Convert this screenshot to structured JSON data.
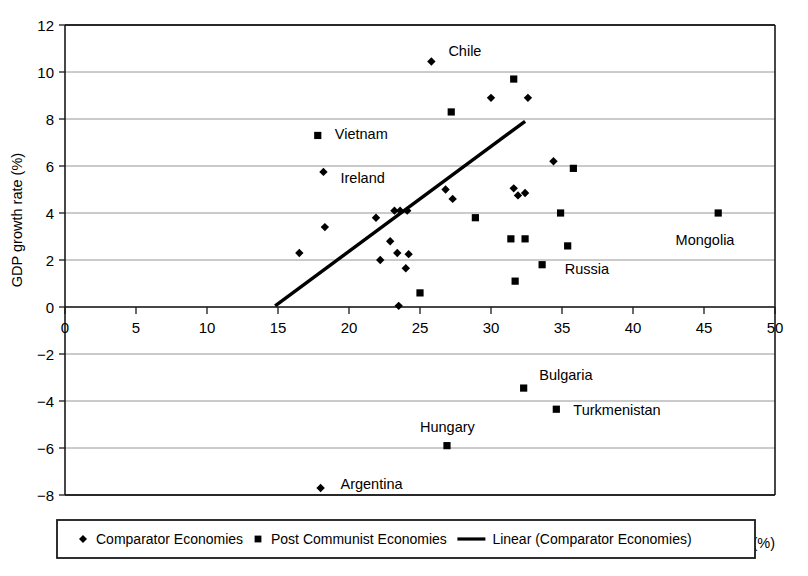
{
  "chart_data": {
    "type": "scatter",
    "title": "",
    "xlabel": "Investment as share of GDP (%)",
    "ylabel": "GDP growth rate (%)",
    "xlim": [
      0,
      50
    ],
    "ylim": [
      -8,
      12
    ],
    "xticks": [
      0,
      5,
      10,
      15,
      20,
      25,
      30,
      35,
      40,
      45,
      50
    ],
    "yticks": [
      -8,
      -6,
      -4,
      -2,
      0,
      2,
      4,
      6,
      8,
      10,
      12
    ],
    "xtick_labels": [
      "0",
      "5",
      "10",
      "15",
      "20",
      "25",
      "30",
      "35",
      "40",
      "45",
      "50"
    ],
    "ytick_labels": [
      "−8",
      "−6",
      "−4",
      "−2",
      "0",
      "2",
      "4",
      "6",
      "8",
      "10",
      "12"
    ],
    "grid": "horizontal",
    "legend_position": "bottom",
    "series": [
      {
        "name": "Comparator Economies",
        "marker": "diamond",
        "color": "#000000",
        "points": [
          {
            "x": 16.5,
            "y": 2.3,
            "label": ""
          },
          {
            "x": 18.3,
            "y": 3.4,
            "label": ""
          },
          {
            "x": 18.2,
            "y": 5.75,
            "label": "Ireland"
          },
          {
            "x": 21.9,
            "y": 3.8,
            "label": ""
          },
          {
            "x": 22.2,
            "y": 2.0,
            "label": ""
          },
          {
            "x": 22.9,
            "y": 2.8,
            "label": ""
          },
          {
            "x": 23.2,
            "y": 4.1,
            "label": ""
          },
          {
            "x": 23.6,
            "y": 4.1,
            "label": ""
          },
          {
            "x": 24.1,
            "y": 4.1,
            "label": ""
          },
          {
            "x": 23.4,
            "y": 2.3,
            "label": ""
          },
          {
            "x": 24.2,
            "y": 2.25,
            "label": ""
          },
          {
            "x": 24.0,
            "y": 1.65,
            "label": ""
          },
          {
            "x": 23.5,
            "y": 0.05,
            "label": ""
          },
          {
            "x": 25.8,
            "y": 10.45,
            "label": "Chile"
          },
          {
            "x": 26.8,
            "y": 5.0,
            "label": ""
          },
          {
            "x": 27.3,
            "y": 4.6,
            "label": ""
          },
          {
            "x": 30.0,
            "y": 8.9,
            "label": ""
          },
          {
            "x": 31.6,
            "y": 5.05,
            "label": ""
          },
          {
            "x": 31.9,
            "y": 4.75,
            "label": ""
          },
          {
            "x": 32.4,
            "y": 4.85,
            "label": ""
          },
          {
            "x": 32.6,
            "y": 8.9,
            "label": ""
          },
          {
            "x": 34.4,
            "y": 6.2,
            "label": ""
          },
          {
            "x": 18.0,
            "y": -7.7,
            "label": "Argentina"
          }
        ]
      },
      {
        "name": "Post Communist Economies",
        "marker": "square",
        "color": "#000000",
        "points": [
          {
            "x": 17.8,
            "y": 7.3,
            "label": "Vietnam"
          },
          {
            "x": 25.0,
            "y": 0.6,
            "label": ""
          },
          {
            "x": 27.2,
            "y": 8.3,
            "label": ""
          },
          {
            "x": 28.9,
            "y": 3.8,
            "label": ""
          },
          {
            "x": 31.4,
            "y": 2.9,
            "label": ""
          },
          {
            "x": 31.6,
            "y": 9.7,
            "label": ""
          },
          {
            "x": 31.7,
            "y": 1.1,
            "label": ""
          },
          {
            "x": 32.4,
            "y": 2.9,
            "label": "Russia"
          },
          {
            "x": 33.6,
            "y": 1.8,
            "label": ""
          },
          {
            "x": 34.9,
            "y": 4.0,
            "label": ""
          },
          {
            "x": 35.4,
            "y": 2.6,
            "label": ""
          },
          {
            "x": 35.8,
            "y": 5.9,
            "label": ""
          },
          {
            "x": 46.0,
            "y": 4.0,
            "label": "Mongolia"
          },
          {
            "x": 32.3,
            "y": -3.45,
            "label": "Bulgaria"
          },
          {
            "x": 34.6,
            "y": -4.35,
            "label": "Turkmenistan"
          },
          {
            "x": 26.9,
            "y": -5.9,
            "label": "Hungary"
          }
        ]
      }
    ],
    "trendline": {
      "name": "Linear (Comparator Economies)",
      "x0": 14.8,
      "y0": 0.05,
      "x1": 32.4,
      "y1": 7.9,
      "color": "#000000"
    },
    "annotations": [
      {
        "text": "Chile",
        "x": 27.0,
        "y": 10.9
      },
      {
        "text": "Vietnam",
        "x": 19.0,
        "y": 7.35
      },
      {
        "text": "Ireland",
        "x": 19.4,
        "y": 5.5
      },
      {
        "text": "Mongolia",
        "x": 43.0,
        "y": 2.85
      },
      {
        "text": "Russia",
        "x": 35.2,
        "y": 1.6
      },
      {
        "text": "Bulgaria",
        "x": 33.4,
        "y": -2.9
      },
      {
        "text": "Turkmenistan",
        "x": 35.8,
        "y": -4.4
      },
      {
        "text": "Hungary",
        "x": 25.0,
        "y": -5.1
      },
      {
        "text": "Argentina",
        "x": 19.4,
        "y": -7.55
      }
    ]
  },
  "legend": {
    "items": [
      {
        "marker": "diamond",
        "label": "Comparator Economies"
      },
      {
        "marker": "square",
        "label": "Post Communist Economies"
      },
      {
        "marker": "line",
        "label": "Linear (Comparator Economies)"
      }
    ]
  },
  "colors": {
    "ink": "#000000",
    "grid": "#8a8a8a",
    "frame": "#1a1a1a",
    "background": "#ffffff"
  }
}
